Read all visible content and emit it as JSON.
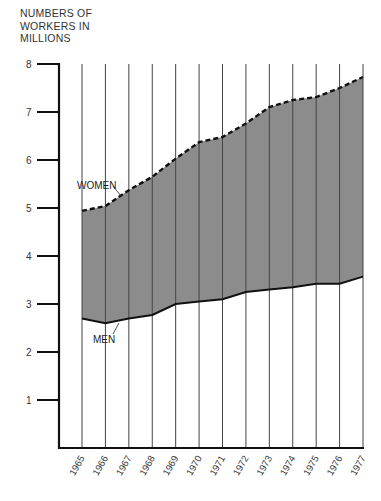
{
  "chart_data": {
    "type": "area",
    "title": "",
    "ylabel": "NUMBERS OF WORKERS IN MILLIONS",
    "ylabel_lines": [
      "NUMBERS OF",
      "WORKERS IN",
      "MILLIONS"
    ],
    "xlabel": "",
    "x": [
      1965,
      1966,
      1967,
      1968,
      1969,
      1970,
      1971,
      1972,
      1973,
      1974,
      1975,
      1976,
      1977
    ],
    "x_tick_labels": [
      "1965",
      "1966",
      "1967",
      "1968",
      "1969",
      "1970",
      "1971",
      "1972",
      "1973",
      "1974",
      "1975",
      "1976",
      "1977"
    ],
    "y_ticks": [
      1,
      2,
      3,
      4,
      5,
      6,
      7,
      8
    ],
    "y_tick_labels": [
      "1",
      "2",
      "3",
      "4",
      "5",
      "6",
      "7",
      "8"
    ],
    "ylim": [
      0,
      8
    ],
    "grid": "vertical lines at each year",
    "series": [
      {
        "name": "MEN",
        "line_style": "solid",
        "values": [
          2.7,
          2.6,
          2.7,
          2.77,
          3.0,
          3.05,
          3.1,
          3.25,
          3.3,
          3.35,
          3.42,
          3.42,
          3.57
        ]
      },
      {
        "name": "WOMEN",
        "line_style": "dashed",
        "note": "cumulative total (men + women); shaded band between lines represents women",
        "values": [
          4.94,
          5.04,
          5.37,
          5.65,
          6.03,
          6.37,
          6.48,
          6.76,
          7.1,
          7.25,
          7.31,
          7.5,
          7.73
        ]
      }
    ],
    "annotations": [
      {
        "text": "WOMEN",
        "points_to": "dashed upper line near 1966-1967"
      },
      {
        "text": "MEN",
        "points_to": "solid lower line near 1966-1967"
      }
    ],
    "colors": {
      "band_fill": "#8c8c8c",
      "axis": "#111111",
      "grid": "#444444"
    }
  }
}
